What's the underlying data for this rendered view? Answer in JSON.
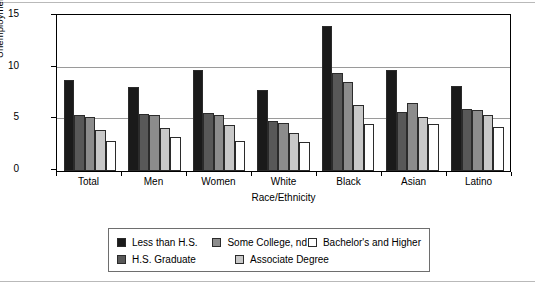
{
  "chart_data": {
    "type": "bar",
    "title": "",
    "xlabel": "Race/Ethnicity",
    "ylabel": "Unemployment Rate",
    "ylim": [
      0,
      15
    ],
    "yticks": [
      0,
      5,
      10,
      15
    ],
    "grid": true,
    "legend_position": "bottom",
    "categories": [
      "Total",
      "Men",
      "Women",
      "White",
      "Black",
      "Asian",
      "Latino"
    ],
    "series": [
      {
        "name": "Less than H.S.",
        "color": "#1a1a1a",
        "values": [
          8.8,
          8.1,
          9.7,
          7.8,
          14.0,
          9.7,
          8.2
        ]
      },
      {
        "name": "H.S. Graduate",
        "color": "#585858",
        "values": [
          5.4,
          5.5,
          5.6,
          4.8,
          9.4,
          5.7,
          6.0
        ]
      },
      {
        "name": "Some College, nd",
        "color": "#8c8c8c",
        "values": [
          5.2,
          5.4,
          5.4,
          4.6,
          8.6,
          6.5,
          5.9
        ]
      },
      {
        "name": "Associate Degree",
        "color": "#c8c8c8",
        "values": [
          3.9,
          4.1,
          4.4,
          3.6,
          6.3,
          5.2,
          5.4
        ]
      },
      {
        "name": "Bachelor's and Higher",
        "color": "#ffffff",
        "values": [
          2.9,
          3.2,
          2.9,
          2.8,
          4.5,
          4.5,
          4.2
        ]
      }
    ]
  },
  "axis": {
    "y_title": "Unemployment Rate",
    "x_title": "Race/Ethnicity",
    "y_tick_labels": [
      "15",
      "10",
      "5",
      "0"
    ]
  },
  "legend": {
    "entries": [
      {
        "label": "Less than H.S."
      },
      {
        "label": "Some College, nd"
      },
      {
        "label": "Bachelor's and Higher"
      },
      {
        "label": "H.S. Graduate"
      },
      {
        "label": "Associate Degree"
      }
    ]
  }
}
